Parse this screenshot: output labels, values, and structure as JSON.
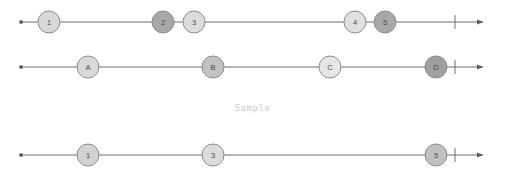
{
  "canvas": {
    "width": 505,
    "height": 171,
    "background": "#ffffff"
  },
  "style": {
    "line_color": "#6f6f6f",
    "line_width": 1,
    "node_stroke": "#8c8c8c",
    "node_radius": 11,
    "label_color": "#4a4a4a",
    "caption_color": "#c9c9c9",
    "fill_light": "#d8d8d8",
    "fill_medium": "#bdbdbd",
    "fill_dark": "#a0a0a0",
    "fill_lightest": "#e2e2e2"
  },
  "caption": {
    "text": "Sample"
  },
  "axes": [
    {
      "id": "axis-top",
      "y": 22,
      "start_x": 21,
      "end_x": 483,
      "start_marker": "square-dot",
      "end_marker": "arrowhead",
      "tick_x": 455,
      "tick_half_height": 7,
      "nodes": [
        {
          "label": "1",
          "x": 49,
          "fill": "#d8d8d8"
        },
        {
          "label": "2",
          "x": 163,
          "fill": "#a8a8a8"
        },
        {
          "label": "3",
          "x": 194,
          "fill": "#dcdcdc"
        },
        {
          "label": "4",
          "x": 355,
          "fill": "#e0e0e0"
        },
        {
          "label": "5",
          "x": 385,
          "fill": "#a8a8a8"
        }
      ]
    },
    {
      "id": "axis-middle",
      "y": 67,
      "start_x": 21,
      "end_x": 483,
      "start_marker": "square-dot",
      "end_marker": "arrowhead",
      "tick_x": 455,
      "tick_half_height": 7,
      "nodes": [
        {
          "label": "A",
          "x": 88,
          "fill": "#d8d8d8"
        },
        {
          "label": "B",
          "x": 213,
          "fill": "#c2c2c2"
        },
        {
          "label": "C",
          "x": 330,
          "fill": "#e6e6e6"
        },
        {
          "label": "D",
          "x": 436,
          "fill": "#a0a0a0"
        }
      ]
    },
    {
      "id": "axis-bottom",
      "y": 155,
      "start_x": 21,
      "end_x": 483,
      "start_marker": "square-dot",
      "end_marker": "arrowhead",
      "tick_x": 455,
      "tick_half_height": 7,
      "nodes": [
        {
          "label": "1",
          "x": 88,
          "fill": "#d2d2d2"
        },
        {
          "label": "3",
          "x": 213,
          "fill": "#dcdcdc"
        },
        {
          "label": "5",
          "x": 436,
          "fill": "#c0c0c0"
        }
      ]
    }
  ]
}
